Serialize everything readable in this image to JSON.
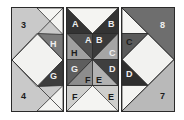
{
  "figure": {
    "type": "quilt-block-diagram",
    "panel_count": 3,
    "background_color": "#ffffff"
  },
  "palette": {
    "white": "#f2f2f0",
    "light_gray": "#c9c9c9",
    "mid_gray": "#9a9a9a",
    "mid_dark_gray": "#6e6e6e",
    "dark_gray": "#4a4a4a",
    "near_black": "#2e2e2e",
    "border": "#2a2a2a",
    "label_dark": "#1c1c1c",
    "label_light": "#efefef"
  },
  "panels": [
    {
      "name": "left-panel",
      "labels": [
        {
          "text": "3",
          "position": "top-left",
          "tone": "dark"
        },
        {
          "text": "4",
          "position": "bottom-left",
          "tone": "dark"
        },
        {
          "text": "H",
          "position": "upper-right",
          "tone": "light"
        },
        {
          "text": "G",
          "position": "lower-right",
          "tone": "light"
        }
      ]
    },
    {
      "name": "middle-panel",
      "labels": [
        {
          "text": "A",
          "position": "outer-top-left",
          "tone": "light"
        },
        {
          "text": "B",
          "position": "outer-top-right",
          "tone": "light"
        },
        {
          "text": "A",
          "position": "inner-top-left",
          "tone": "light"
        },
        {
          "text": "B",
          "position": "inner-top-right",
          "tone": "light"
        },
        {
          "text": "H",
          "position": "inner-left-upper",
          "tone": "dark"
        },
        {
          "text": "C",
          "position": "inner-right-upper",
          "tone": "light"
        },
        {
          "text": "G",
          "position": "inner-left-lower",
          "tone": "light"
        },
        {
          "text": "D",
          "position": "inner-right-lower",
          "tone": "light"
        },
        {
          "text": "F",
          "position": "inner-bottom-left",
          "tone": "dark"
        },
        {
          "text": "E",
          "position": "inner-bottom-right",
          "tone": "dark"
        },
        {
          "text": "F",
          "position": "outer-bottom-left",
          "tone": "dark"
        },
        {
          "text": "E",
          "position": "outer-bottom-right",
          "tone": "dark"
        }
      ]
    },
    {
      "name": "right-panel",
      "labels": [
        {
          "text": "8",
          "position": "top-right",
          "tone": "light"
        },
        {
          "text": "7",
          "position": "bottom-right",
          "tone": "dark"
        },
        {
          "text": "C",
          "position": "upper-left",
          "tone": "dark"
        },
        {
          "text": "D",
          "position": "lower-left",
          "tone": "light"
        }
      ]
    }
  ]
}
